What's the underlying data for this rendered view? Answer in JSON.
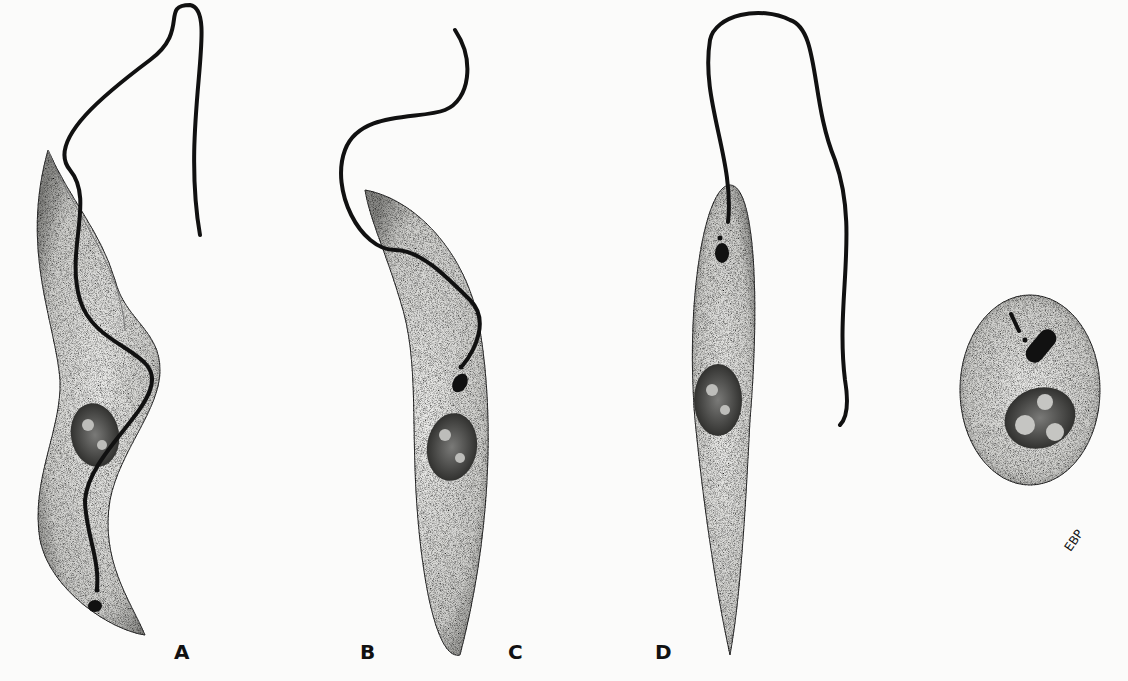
{
  "figure": {
    "labels": [
      "A",
      "B",
      "C",
      "D"
    ],
    "signature": "EBP",
    "colors": {
      "background": "#fbfbfa",
      "ink": "#111111",
      "cell_fill": "#d9d9d6"
    }
  }
}
